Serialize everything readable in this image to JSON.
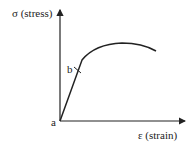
{
  "y_axis_label": "σ (stress)",
  "x_axis_label": "ε (strain)",
  "points": {
    "origin_label": "a",
    "yield_label": "b"
  },
  "colors": {
    "line": "#222222",
    "background": "#ffffff"
  }
}
